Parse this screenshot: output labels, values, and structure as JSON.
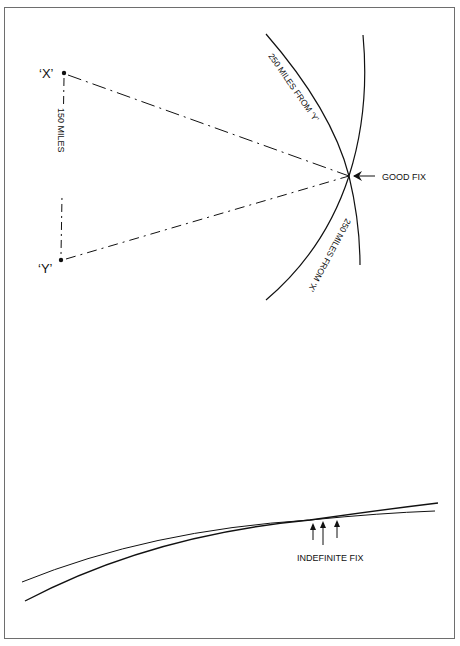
{
  "diagram": {
    "colors": {
      "line": "#111111",
      "frame": "#6e6e6e",
      "background": "#ffffff"
    },
    "good_fix": {
      "points": [
        {
          "id": "X",
          "label": "‘X’"
        },
        {
          "id": "Y",
          "label": "‘Y’"
        }
      ],
      "baseline_label": "150 MILES",
      "arc_from_y_label": "250 MILES FROM ‘Y’",
      "arc_from_x_label": "250 MILES FROM ‘X’",
      "fix_label": "GOOD FIX"
    },
    "indefinite_fix": {
      "fix_label": "INDEFINITE FIX",
      "arrow_count": 3
    }
  }
}
